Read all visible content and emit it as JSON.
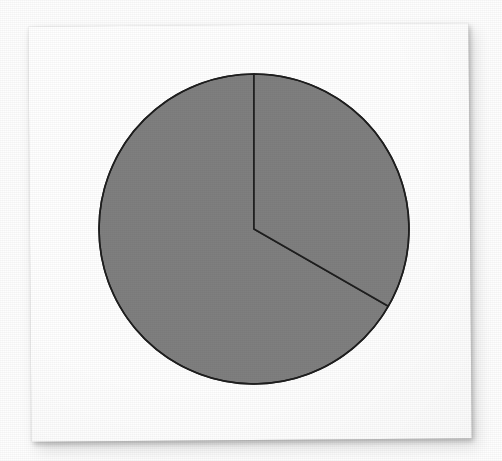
{
  "figure": {
    "title": "",
    "background_color": "#ffffff",
    "card_color": "#ffffff",
    "card_rotation_deg": -0.45
  },
  "chart_data": {
    "type": "pie",
    "title": "",
    "subtitle": "",
    "xlabel": "",
    "ylabel": "",
    "legend": [],
    "legend_position": "none",
    "grid": false,
    "labels": [
      "Slice 1",
      "Slice 2"
    ],
    "values": [
      33.3,
      66.7
    ],
    "angles_deg": [
      120,
      240
    ],
    "fractions": [
      "1/3",
      "2/3"
    ],
    "colors": [
      "#7f7f7f",
      "#7f7f7f"
    ],
    "edge_color": "#1e1e1e",
    "edge_width": 1.5,
    "start_angle_deg": 90,
    "direction": "clockwise",
    "center_px": [
      254,
      229
    ],
    "radius_px": 155,
    "annotations": []
  },
  "geometry": {
    "cx": 254,
    "cy": 229,
    "r": 155,
    "boundary_top_px": [
      254,
      74
    ],
    "boundary_second_px": [
      388,
      306
    ]
  }
}
